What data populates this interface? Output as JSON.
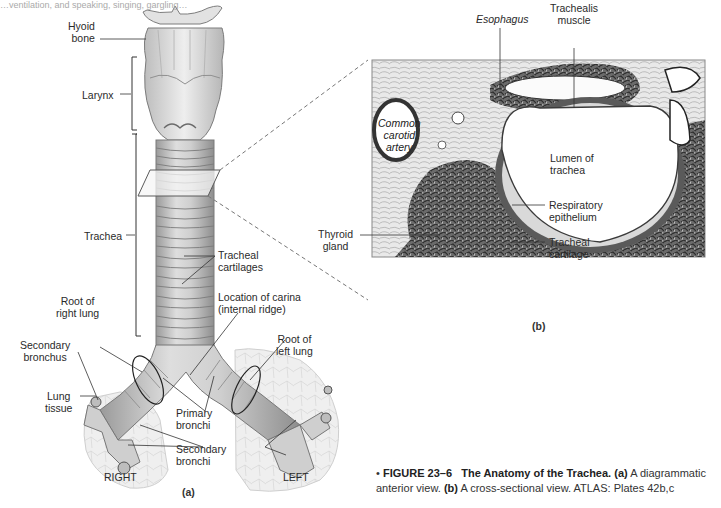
{
  "header_fragment": "…ventilation, and speaking, singing, gargling…",
  "panel_a": {
    "sublabel": "(a)",
    "labels": {
      "hyoid_bone": "Hyoid\nbone",
      "larynx": "Larynx",
      "trachea": "Trachea",
      "tracheal_cartilages": "Tracheal\ncartilages",
      "carina": "Location of carina\n(internal ridge)",
      "root_right_lung": "Root of\nright lung",
      "root_left_lung": "Root of\nleft lung",
      "secondary_bronchus": "Secondary\nbronchus",
      "lung_tissue": "Lung\ntissue",
      "primary_bronchi": "Primary\nbronchi",
      "secondary_bronchi": "Secondary\nbronchi",
      "right": "RIGHT",
      "left": "LEFT"
    }
  },
  "panel_b": {
    "sublabel": "(b)",
    "labels": {
      "esophagus": "Esophagus",
      "trachealis_muscle": "Trachealis\nmuscle",
      "common_carotid_artery": "Common\ncarotid\nartery",
      "lumen_of_trachea": "Lumen of\ntrachea",
      "respiratory_epithelium": "Respiratory\nepithelium",
      "tracheal_cartilage": "Tracheal\ncartilage",
      "thyroid_gland": "Thyroid\ngland"
    }
  },
  "caption": {
    "bullet": "•",
    "figure_number": "FIGURE 23–6",
    "title": "The Anatomy of the Trachea.",
    "part_a_tag": "(a)",
    "part_a_text": "A diagrammatic",
    "line2_start": "anterior view.",
    "part_b_tag": "(b)",
    "part_b_text": "A cross-sectional view.",
    "atlas": "ATLAS: Plates 42b,c"
  },
  "colors": {
    "tissue_dark": "#4a4a4a",
    "tissue_mid": "#8a8a8a",
    "cartilage": "#d8d8d8",
    "bg": "#ffffff"
  }
}
